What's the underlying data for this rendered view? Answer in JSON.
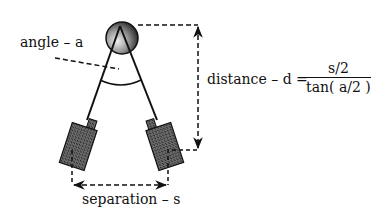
{
  "diagram": {
    "type": "stereo camera triangulation",
    "labels": {
      "angle": "angle  –  a",
      "distance": "distance  –  d  =",
      "separation": "separation  –  s",
      "formula_numerator": "s/2",
      "formula_denominator": "tan( a/2 )"
    },
    "elements": {
      "target": "shaded sphere (target object)",
      "left_camera": "left camera",
      "right_camera": "right camera",
      "angle_arc": "angle arc between sight lines",
      "distance_arrow": "vertical dashed double arrow",
      "separation_arrow": "horizontal dashed double arrow"
    },
    "colors": {
      "line": "#111111",
      "camera_fill": "#555555",
      "sphere_light": "#e8e8e8",
      "sphere_dark": "#111111"
    }
  }
}
